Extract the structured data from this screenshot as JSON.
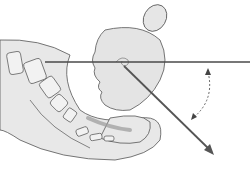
{
  "diagram": {
    "colors": {
      "background": "#ffffff",
      "tissue_fill": "#e4e4e4",
      "outline": "#4a4a4a",
      "bone_fill": "#f2f2f2",
      "reference_line": "#5a5a5a",
      "shadow": "#9a9a9a"
    },
    "elements": [
      {
        "name": "fetal-head",
        "label": "Fetal head"
      },
      {
        "name": "placenta-oval",
        "label": "Oval structure above head"
      },
      {
        "name": "pelvis-sacrum",
        "label": "Sacrum / coccyx vertebrae"
      },
      {
        "name": "horizontal-reference-line",
        "label": "Horizontal reference line"
      },
      {
        "name": "direction-arrow",
        "label": "Diagonal arrow"
      },
      {
        "name": "rotation-arrow",
        "label": "Dashed curved arrow"
      }
    ]
  }
}
